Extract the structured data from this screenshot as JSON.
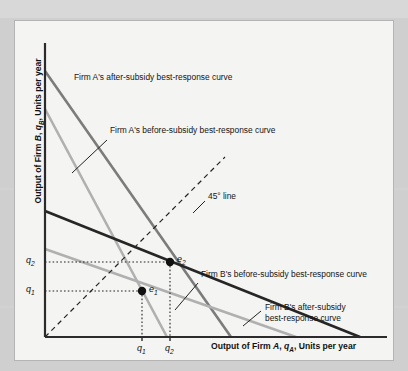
{
  "page": {
    "top_text": "",
    "background_color": "#cfcfcf",
    "card_color": "#f4f4f2"
  },
  "axes": {
    "y_label_prefix": "Output of Firm ",
    "y_label_firm": "B",
    "y_label_symbol": "q",
    "y_label_symbol_sub": "B",
    "y_label_suffix": ", Units per year",
    "x_label_prefix": "Output of Firm ",
    "x_label_firm": "A",
    "x_label_symbol": "q",
    "x_label_symbol_sub": "A",
    "x_label_suffix": ", Units per year",
    "y_ticks": [
      {
        "symbol": "q",
        "sub": "2",
        "value_px": 241
      },
      {
        "symbol": "q",
        "sub": "1",
        "value_px": 270
      }
    ],
    "x_ticks": [
      {
        "symbol": "q",
        "sub": "1",
        "value_px": 127
      },
      {
        "symbol": "q",
        "sub": "2",
        "value_px": 155
      }
    ]
  },
  "points": [
    {
      "name": "e1",
      "symbol": "e",
      "sub": "1",
      "x_px": 127,
      "y_px": 270
    },
    {
      "name": "e2",
      "symbol": "e",
      "sub": "2",
      "x_px": 155,
      "y_px": 241
    }
  ],
  "annotations": {
    "firm_a_after": "Firm A's after-subsidy best-response curve",
    "firm_a_before": "Firm A's before-subsidy best-response curve",
    "forty_five": "45° line",
    "firm_b_before": "Firm B's before-subsidy best-response curve",
    "firm_b_after_line1": "Firm B's after-subsidy",
    "firm_b_after_line2": "best-response curve"
  },
  "chart_data": {
    "type": "line",
    "title": "",
    "xlabel": "Output of Firm A, qA, Units per year",
    "ylabel": "Output of Firm B, qB, Units per year",
    "xlim": [
      0,
      340
    ],
    "ylim": [
      0,
      320
    ],
    "grid": false,
    "legend": "inline-annotations",
    "origin_px": {
      "x": 30,
      "y": 316
    },
    "series": [
      {
        "name": "Firm A's after-subsidy best-response curve",
        "color": "#7c7c7c",
        "width": 2.6,
        "dash": "none",
        "points_px": [
          {
            "x": 30,
            "y": 50
          },
          {
            "x": 216,
            "y": 316
          }
        ]
      },
      {
        "name": "Firm A's before-subsidy best-response curve",
        "color": "#b0b0b0",
        "width": 2.6,
        "dash": "none",
        "points_px": [
          {
            "x": 30,
            "y": 88
          },
          {
            "x": 152,
            "y": 316
          }
        ]
      },
      {
        "name": "Firm B's before-subsidy best-response curve",
        "color": "#b0b0b0",
        "width": 2.6,
        "dash": "none",
        "points_px": [
          {
            "x": 30,
            "y": 228
          },
          {
            "x": 281,
            "y": 316
          }
        ]
      },
      {
        "name": "Firm B's after-subsidy best-response curve",
        "color": "#262626",
        "width": 2.8,
        "dash": "none",
        "points_px": [
          {
            "x": 30,
            "y": 190
          },
          {
            "x": 345,
            "y": 316
          }
        ]
      },
      {
        "name": "45° line",
        "color": "#222222",
        "width": 1.2,
        "dash": "5,4",
        "points_px": [
          {
            "x": 30,
            "y": 316
          },
          {
            "x": 210,
            "y": 136
          }
        ]
      }
    ],
    "leader_lines_px": [
      {
        "name": "leader-firm-a-before",
        "x1": 92,
        "y1": 119,
        "x2": 57,
        "y2": 152
      },
      {
        "name": "leader-45",
        "x1": 190,
        "y1": 180,
        "x2": 178,
        "y2": 192
      },
      {
        "name": "leader-firm-b-before",
        "x1": 183,
        "y1": 262,
        "x2": 160,
        "y2": 289
      },
      {
        "name": "leader-firm-b-after",
        "x1": 246,
        "y1": 290,
        "x2": 228,
        "y2": 305
      }
    ],
    "dotted_guides_px": [
      {
        "name": "guide-q2-horizontal",
        "x1": 30,
        "y1": 241,
        "x2": 155,
        "y2": 241
      },
      {
        "name": "guide-q1-horizontal",
        "x1": 30,
        "y1": 270,
        "x2": 127,
        "y2": 270
      },
      {
        "name": "guide-q1-vertical",
        "x1": 127,
        "y1": 270,
        "x2": 127,
        "y2": 316
      },
      {
        "name": "guide-q2-vertical",
        "x1": 155,
        "y1": 241,
        "x2": 155,
        "y2": 316
      }
    ]
  }
}
